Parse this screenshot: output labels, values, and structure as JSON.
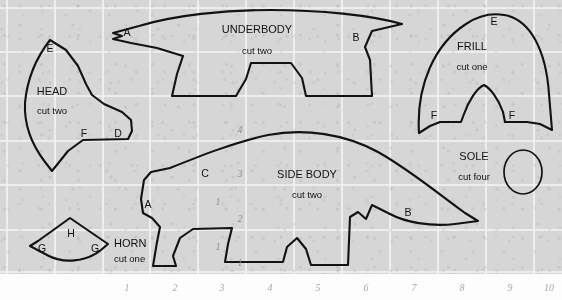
{
  "sheet": {
    "title": "dinosaur-sewing-pattern-sheet",
    "background_color": "#d6d6d6",
    "grid_line_color": "#f4f4f4",
    "ink_color": "#121212"
  },
  "grid": {
    "vertical_x": [
      7,
      55,
      103,
      150,
      198,
      246,
      294,
      342,
      390,
      438,
      486,
      534
    ],
    "horizontal_y": [
      8,
      52,
      96,
      141,
      185,
      230,
      272
    ],
    "cell_width": 48,
    "cell_height": 45
  },
  "scale": {
    "bottom_numbers": [
      "1",
      "2",
      "3",
      "4",
      "5",
      "6",
      "7",
      "8",
      "9",
      "10"
    ],
    "bottom_x": [
      127,
      175,
      222,
      270,
      318,
      366,
      414,
      462,
      510,
      549
    ],
    "bottom_y": 291,
    "left_numbers": [
      "4",
      "3",
      "2",
      "1"
    ],
    "left_x": [
      240,
      240,
      240,
      240
    ],
    "left_y": [
      133,
      177,
      222,
      266
    ],
    "inner_marks": [
      "1",
      "1"
    ],
    "inner_marks_x": [
      218,
      218
    ],
    "inner_marks_y": [
      205,
      250
    ]
  },
  "pieces": [
    {
      "id": "head",
      "title": "HEAD",
      "cut": "cut two",
      "title_x": 52,
      "title_y": 95,
      "cut_x": 52,
      "cut_y": 114,
      "marks": [
        {
          "letter": "E",
          "x": 50,
          "y": 52
        },
        {
          "letter": "F",
          "x": 84,
          "y": 137
        },
        {
          "letter": "D",
          "x": 118,
          "y": 137
        }
      ]
    },
    {
      "id": "underbody",
      "title": "UNDERBODY",
      "cut": "cut two",
      "title_x": 257,
      "title_y": 33,
      "cut_x": 257,
      "cut_y": 54,
      "marks": [
        {
          "letter": "A",
          "x": 127,
          "y": 36
        },
        {
          "letter": "B",
          "x": 356,
          "y": 41
        }
      ]
    },
    {
      "id": "frill",
      "title": "FRILL",
      "cut": "cut one",
      "title_x": 472,
      "title_y": 50,
      "cut_x": 472,
      "cut_y": 70,
      "marks": [
        {
          "letter": "E",
          "x": 494,
          "y": 25
        },
        {
          "letter": "F",
          "x": 434,
          "y": 119
        },
        {
          "letter": "F",
          "x": 512,
          "y": 119
        }
      ]
    },
    {
      "id": "side-body",
      "title": "SIDE BODY",
      "cut": "cut two",
      "title_x": 307,
      "title_y": 178,
      "cut_x": 307,
      "cut_y": 198,
      "marks": [
        {
          "letter": "C",
          "x": 205,
          "y": 177
        },
        {
          "letter": "A",
          "x": 148,
          "y": 208
        },
        {
          "letter": "B",
          "x": 408,
          "y": 216
        }
      ]
    },
    {
      "id": "sole",
      "title": "SOLE",
      "cut": "cut four",
      "title_x": 474,
      "title_y": 160,
      "cut_x": 474,
      "cut_y": 180,
      "marks": []
    },
    {
      "id": "horn",
      "title": "HORN",
      "cut": "cut one",
      "title_x": 138,
      "title_y": 247,
      "cut_x": 138,
      "cut_y": 262,
      "marks": [
        {
          "letter": "H",
          "x": 71,
          "y": 233
        },
        {
          "letter": "G",
          "x": 41,
          "y": 251
        },
        {
          "letter": "G",
          "x": 96,
          "y": 251
        }
      ]
    }
  ]
}
